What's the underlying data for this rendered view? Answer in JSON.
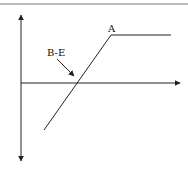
{
  "diagram": {
    "type": "payoff-diagram",
    "labels": {
      "kink_point": "A",
      "break_even": "B-E"
    },
    "colors": {
      "line": "#222222",
      "border": "#777777",
      "background": "#ffffff"
    },
    "elements": {
      "vertical_axis": {
        "x": 21,
        "y_top": 13,
        "y_bottom": 163,
        "arrows": "both"
      },
      "horizontal_axis": {
        "y": 83,
        "x_start": 21,
        "x_end": 182,
        "arrow": "right"
      },
      "payoff_line": {
        "points": [
          [
            44,
            130
          ],
          [
            111,
            35
          ],
          [
            171,
            35
          ]
        ]
      },
      "break_even_arrow": {
        "from": [
          57,
          59
        ],
        "to": [
          75,
          77
        ]
      }
    }
  }
}
